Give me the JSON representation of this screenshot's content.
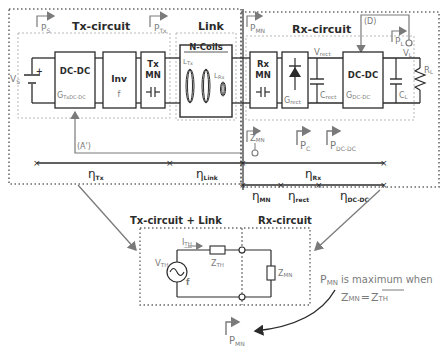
{
  "colors": {
    "ink": "#2b2b2b",
    "gray": "#7a7a7a",
    "dotted": "#6a6a6a",
    "light": "#b8b8b8"
  },
  "sections": {
    "tx_circuit": "Tx-circuit",
    "link": "Link",
    "rx_circuit": "Rx-circuit",
    "n_coils": "N-Coils"
  },
  "powers": {
    "ps": "P",
    "ps_sub": "S",
    "ptx": "P",
    "ptx_sub": "Tx",
    "pmn": "P",
    "pmn_sub": "MN",
    "pl": "P",
    "pl_sub": "L",
    "pc": "P",
    "pc_sub": "C",
    "pdcdc": "P",
    "pdcdc_sub": "DC-DC"
  },
  "blocks": {
    "tx_dcdc": "DC-DC",
    "tx_dcdc_gain": "G",
    "tx_dcdc_gain_sub": "TxDC-DC",
    "inv": "Inv",
    "inv_freq": "f",
    "tx_mn_1": "Tx",
    "tx_mn_2": "MN",
    "rx_mn_1": "Rx",
    "rx_mn_2": "MN",
    "rect_gain": "G",
    "rect_gain_sub": "rect",
    "rx_dcdc": "DC-DC",
    "rx_dcdc_gain": "G",
    "rx_dcdc_gain_sub": "DC-DC"
  },
  "components": {
    "vs": "V",
    "vs_sub": "S",
    "ltx": "L",
    "ltx_sub": "Tx",
    "lrx": "L",
    "lrx_sub": "Rx",
    "vrect": "V",
    "vrect_sub": "rect",
    "crect": "C",
    "crect_sub": "rect",
    "vl": "V",
    "vl_sub": "L",
    "rl": "R",
    "rl_sub": "L",
    "cl": "C",
    "cl_sub": "L",
    "zmn": "Z",
    "zmn_sub": "MN"
  },
  "annotations": {
    "a_prime": "(A')",
    "d": "(D)"
  },
  "efficiencies": {
    "eta": "η",
    "tx": "Tx",
    "link": "Link",
    "rx": "Rx",
    "mn": "MN",
    "rect": "rect",
    "dcdc": "DC-DC"
  },
  "equivalent": {
    "left_title": "Tx-circuit + Link",
    "right_title": "Rx-circuit",
    "ith": "I",
    "ith_sub": "TH",
    "vth": "V",
    "vth_sub": "TH",
    "zth": "Z",
    "zth_sub": "TH",
    "f": "f",
    "zmn": "Z",
    "zmn_sub": "MN",
    "pmn": "P",
    "pmn_sub": "MN"
  },
  "condition": {
    "p": "P",
    "p_sub": "MN",
    "text": "is maximum when",
    "z1": "Z",
    "z1_sub": "MN",
    "eq": "=",
    "z2": "Z",
    "z2_sub": "TH"
  }
}
